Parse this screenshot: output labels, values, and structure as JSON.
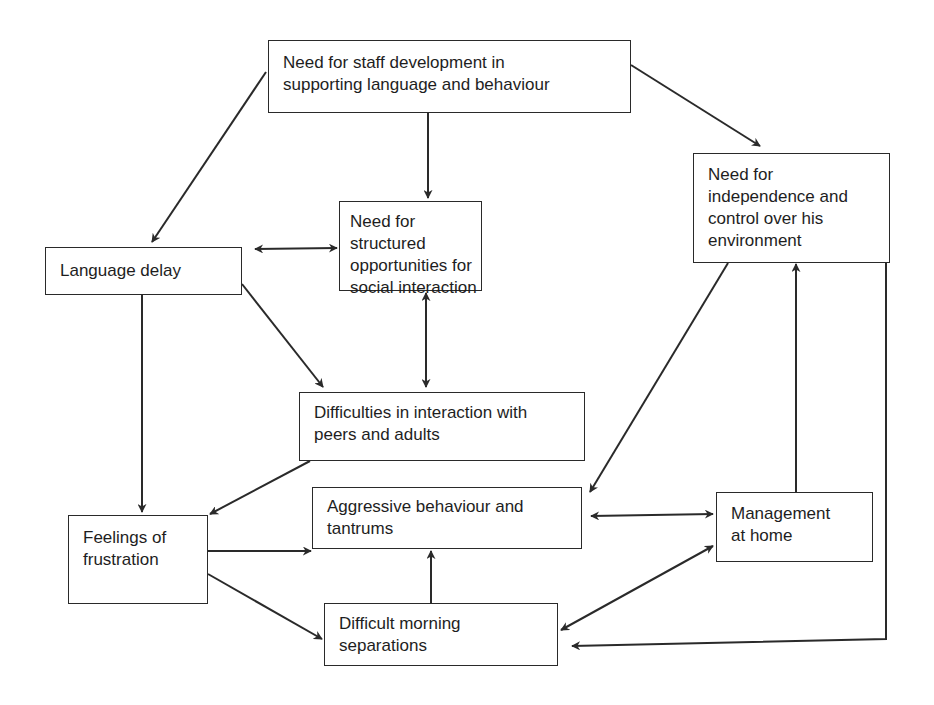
{
  "diagram": {
    "nodes": {
      "staff_development": {
        "label": "Need for staff development in\nsupporting language and behaviour"
      },
      "independence": {
        "label": "Need for\nindependence and\ncontrol over his\nenvironment"
      },
      "structured_opportunities": {
        "label": "Need for structured\nopportunities for\nsocial interaction"
      },
      "language_delay": {
        "label": "Language delay"
      },
      "difficulties_interaction": {
        "label": "Difficulties in interaction with\npeers and adults"
      },
      "aggressive_behaviour": {
        "label": "Aggressive behaviour and\ntantrums"
      },
      "management_home": {
        "label": "Management\nat home"
      },
      "feelings_frustration": {
        "label": "Feelings of\nfrustration"
      },
      "morning_separations": {
        "label": "Difficult morning\nseparations"
      }
    },
    "edges": [
      {
        "from": "staff_development",
        "to": "language_delay",
        "type": "directed"
      },
      {
        "from": "staff_development",
        "to": "structured_opportunities",
        "type": "directed"
      },
      {
        "from": "staff_development",
        "to": "independence",
        "type": "directed"
      },
      {
        "from": "language_delay",
        "to": "structured_opportunities",
        "type": "bidirectional"
      },
      {
        "from": "structured_opportunities",
        "to": "difficulties_interaction",
        "type": "bidirectional"
      },
      {
        "from": "language_delay",
        "to": "difficulties_interaction",
        "type": "directed"
      },
      {
        "from": "language_delay",
        "to": "feelings_frustration",
        "type": "directed"
      },
      {
        "from": "difficulties_interaction",
        "to": "feelings_frustration",
        "type": "directed"
      },
      {
        "from": "independence",
        "to": "aggressive_behaviour",
        "type": "directed"
      },
      {
        "from": "management_home",
        "to": "independence",
        "type": "directed"
      },
      {
        "from": "independence",
        "to": "morning_separations",
        "type": "directed"
      },
      {
        "from": "aggressive_behaviour",
        "to": "management_home",
        "type": "bidirectional"
      },
      {
        "from": "morning_separations",
        "to": "management_home",
        "type": "bidirectional"
      },
      {
        "from": "feelings_frustration",
        "to": "aggressive_behaviour",
        "type": "directed"
      },
      {
        "from": "feelings_frustration",
        "to": "morning_separations",
        "type": "directed"
      },
      {
        "from": "morning_separations",
        "to": "aggressive_behaviour",
        "type": "directed"
      }
    ],
    "colors": {
      "stroke": "#2a2a2a",
      "text": "#1e1e1e",
      "background": "#ffffff"
    }
  }
}
